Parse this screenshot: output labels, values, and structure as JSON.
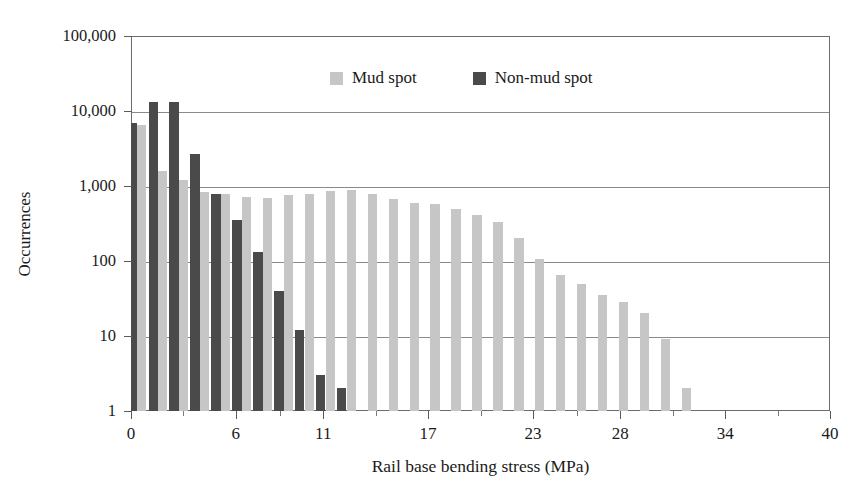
{
  "chart_data": {
    "type": "bar",
    "title": "",
    "subtitle": "",
    "xlabel": "Rail base bending stress (MPa)",
    "ylabel": "Occurrences",
    "yscale": "log",
    "ylim": [
      1,
      100000
    ],
    "xlim": [
      0,
      40
    ],
    "grid": true,
    "legend_position": "top-center-inside",
    "ytick_labels": [
      "100,000",
      "10,000",
      "1,000",
      "100",
      "10",
      "1"
    ],
    "ytick_values": [
      100000,
      10000,
      1000,
      100,
      10,
      1
    ],
    "xtick_labels": [
      "0",
      "6",
      "11",
      "17",
      "23",
      "28",
      "34",
      "40"
    ],
    "xtick_values": [
      0,
      6,
      11,
      17,
      23,
      28,
      34,
      40
    ],
    "x": [
      0.6,
      1.8,
      3.0,
      4.2,
      5.4,
      6.6,
      7.8,
      9.0,
      10.2,
      11.4,
      12.6,
      13.8,
      15.0,
      16.2,
      17.4,
      18.6,
      19.8,
      21.0,
      22.2,
      23.4,
      24.6,
      25.8,
      27.0,
      28.2,
      29.4,
      30.6,
      31.8,
      33.0,
      34.2,
      35.4,
      36.6,
      37.8
    ],
    "series": [
      {
        "name": "Mud spot",
        "color": "#c6c6c6",
        "values": [
          6500,
          1600,
          1200,
          820,
          780,
          720,
          700,
          760,
          790,
          860,
          880,
          780,
          670,
          600,
          570,
          500,
          410,
          330,
          200,
          105,
          65,
          50,
          35,
          28,
          20,
          9,
          2,
          null,
          null,
          null,
          null,
          null
        ]
      },
      {
        "name": "Non-mud spot",
        "color": "#4a4a4a",
        "values": [
          7000,
          13000,
          13000,
          2700,
          790,
          350,
          130,
          40,
          12,
          3,
          2,
          null,
          null,
          null,
          null,
          null,
          null,
          null,
          null,
          null,
          null,
          null,
          null,
          null,
          null,
          null,
          null,
          null,
          null,
          null,
          null,
          null
        ]
      }
    ]
  },
  "legend": {
    "entries": [
      {
        "label": "Mud spot",
        "swatch": "mud"
      },
      {
        "label": "Non-mud spot",
        "swatch": "nonmud"
      }
    ]
  }
}
